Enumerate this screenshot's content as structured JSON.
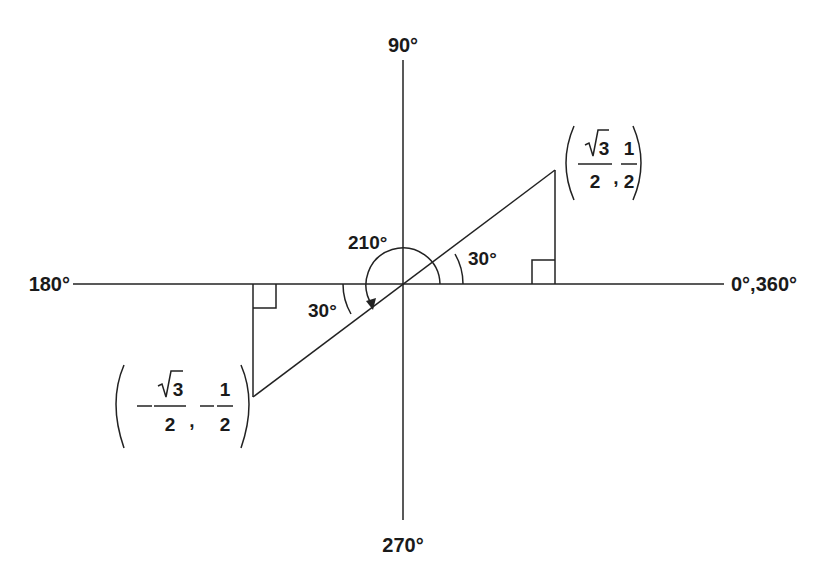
{
  "diagram": {
    "type": "unit-circle-reference-angle",
    "axes": {
      "top_label": "90°",
      "bottom_label": "270°",
      "left_label": "180°",
      "right_label": "0°,360°"
    },
    "angles": {
      "rotation_label": "210°",
      "upper_reference_label": "30°",
      "lower_reference_label": "30°"
    },
    "points": {
      "upper": {
        "x_num": "√3",
        "x_den": "2",
        "y_num": "1",
        "y_den": "2",
        "x_sign": "",
        "y_sign": "",
        "separator": ","
      },
      "lower": {
        "x_num": "√3",
        "x_den": "2",
        "y_num": "1",
        "y_den": "2",
        "x_sign": "−",
        "y_sign": "−",
        "separator": ","
      }
    },
    "colors": {
      "line": "#222222",
      "text": "#1a1a1a",
      "background": "#ffffff"
    }
  }
}
